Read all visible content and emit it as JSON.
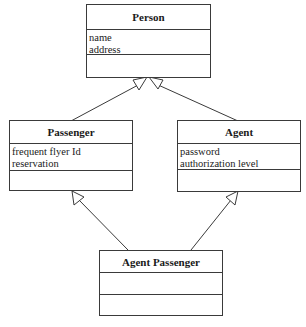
{
  "diagram": {
    "type": "uml-class-diagram",
    "classes": [
      {
        "id": "person",
        "name": "Person",
        "attributes": [
          "name",
          "address"
        ],
        "operations": []
      },
      {
        "id": "passenger",
        "name": "Passenger",
        "attributes": [
          "frequent flyer Id",
          "reservation"
        ],
        "operations": []
      },
      {
        "id": "agent",
        "name": "Agent",
        "attributes": [
          "password",
          "authorization level"
        ],
        "operations": []
      },
      {
        "id": "agent_passenger",
        "name": "Agent Passenger",
        "attributes": [],
        "operations": []
      }
    ],
    "relationships": [
      {
        "type": "generalization",
        "from": "Passenger",
        "to": "Person"
      },
      {
        "type": "generalization",
        "from": "Agent",
        "to": "Person"
      },
      {
        "type": "generalization",
        "from": "Agent Passenger",
        "to": "Passenger"
      },
      {
        "type": "generalization",
        "from": "Agent Passenger",
        "to": "Agent"
      }
    ]
  },
  "colors": {
    "line": "#3a3a3a",
    "background": "#ffffff"
  }
}
